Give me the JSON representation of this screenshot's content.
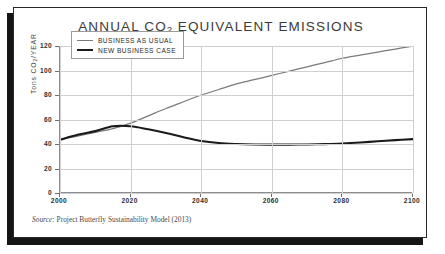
{
  "card": {
    "title_prefix": "ANNUAL CO",
    "title_sub": "2",
    "title_suffix": " EQUIVALENT EMISSIONS"
  },
  "source": {
    "label": "Source:",
    "text": "Project Butterfly Sustainability Model (2013)"
  },
  "colors": {
    "business_as_usual": "#7a7a7a",
    "new_business_case": "#1a1a1a",
    "grid": "#cfcfcf",
    "axis": "#8d8d8d",
    "frame": "#2a2a2a",
    "shadow": "#151515",
    "background": "#ffffff"
  },
  "legend": {
    "position": "inside-top-left",
    "items": [
      {
        "label": "BUSINESS AS USUAL",
        "style": "thin",
        "color": "#7a7a7a"
      },
      {
        "label": "NEW BUSINESS CASE",
        "style": "thick",
        "color": "#1a1a1a"
      }
    ]
  },
  "chart_data": {
    "type": "line",
    "title": "ANNUAL CO2 EQUIVALENT EMISSIONS",
    "xlabel": "",
    "ylabel": "Tons CO2/YEAR",
    "ylabel_prefix": "Tons CO",
    "ylabel_sub": "2",
    "ylabel_suffix": "/YEAR",
    "xlim": [
      2000,
      2100
    ],
    "ylim": [
      0,
      120
    ],
    "xticks": [
      2000,
      2020,
      2040,
      2060,
      2080,
      2100
    ],
    "xtick_labels": [
      "2000",
      "2020",
      "2040",
      "2060",
      "2080",
      "2100"
    ],
    "yticks": [
      0,
      20,
      40,
      60,
      80,
      100,
      120
    ],
    "ytick_labels": [
      "0",
      "20",
      "40",
      "60",
      "80",
      "100",
      "120"
    ],
    "grid": true,
    "legend_position": "upper left",
    "x": [
      2000,
      2005,
      2010,
      2015,
      2020,
      2025,
      2030,
      2035,
      2040,
      2045,
      2050,
      2055,
      2060,
      2065,
      2070,
      2075,
      2080,
      2085,
      2090,
      2095,
      2100
    ],
    "series": [
      {
        "name": "BUSINESS AS USUAL",
        "color": "#7a7a7a",
        "values": [
          43.5,
          46.5,
          49.5,
          52.5,
          57.0,
          63.0,
          69.0,
          74.5,
          80.0,
          84.5,
          89.0,
          92.5,
          96.0,
          99.5,
          103.0,
          106.5,
          110.0,
          112.5,
          115.0,
          117.5,
          120.0
        ]
      },
      {
        "name": "NEW BUSINESS CASE",
        "color": "#1a1a1a",
        "values": [
          43.5,
          47.5,
          50.5,
          54.5,
          54.5,
          52.0,
          49.0,
          45.5,
          42.5,
          40.8,
          40.0,
          39.6,
          39.5,
          39.5,
          39.6,
          39.9,
          40.4,
          41.2,
          42.2,
          43.2,
          44.0
        ]
      }
    ],
    "annotations": [
      {
        "text": "Curves cross near 2017 at about 55 tons CO2/year"
      }
    ]
  }
}
